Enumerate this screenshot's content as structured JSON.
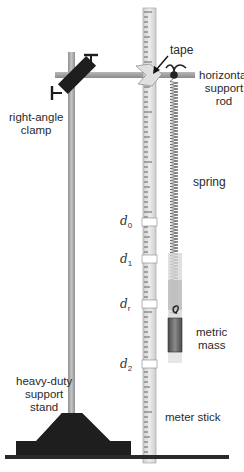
{
  "diagram": {
    "labels": {
      "tape": "tape",
      "horizontal_support_rod": [
        "horizontal",
        "support",
        "rod"
      ],
      "right_angle_clamp": [
        "right-angle",
        "clamp"
      ],
      "spring": "spring",
      "metric_mass": [
        "metric",
        "mass"
      ],
      "heavy_duty_support_stand": [
        "heavy-duty",
        "support",
        "stand"
      ],
      "meter_stick": "meter stick"
    },
    "positions": [
      {
        "symbol": "d",
        "subscript": "0"
      },
      {
        "symbol": "d",
        "subscript": "1"
      },
      {
        "symbol": "d",
        "subscript": "r"
      },
      {
        "symbol": "d",
        "subscript": "2"
      }
    ],
    "colors": {
      "rod": "#a8a8a8",
      "clamp": "#1e1e1e",
      "stand_base": "#1e1e1e",
      "meter_stick": "#e4e4e4",
      "mass": "#6e6e6e",
      "spring": "#555555",
      "table": "#2a2a2a"
    }
  }
}
